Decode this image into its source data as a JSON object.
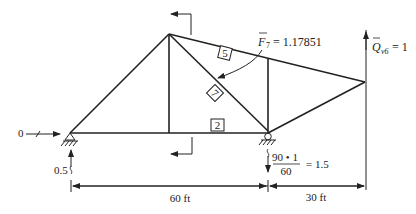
{
  "diagram": {
    "type": "truss-influence-analysis",
    "members": {
      "label_5": "5",
      "label_7": "7",
      "label_2": "2"
    },
    "force_label": {
      "symbol": "F",
      "subscript": "7",
      "equals": "= 1.17851"
    },
    "load_label": {
      "symbol": "Q",
      "subscript": "v6",
      "equals": "= 1"
    },
    "left_support": {
      "horizontal_reaction": "0",
      "vertical_reaction": "0.5"
    },
    "right_support": {
      "reaction_numerator": "90 • 1",
      "reaction_denominator": "60",
      "reaction_result": "= 1.5"
    },
    "dimensions": {
      "left_span": "60 ft",
      "right_overhang": "30 ft"
    },
    "colors": {
      "line": "#222222",
      "background": "#ffffff"
    }
  }
}
